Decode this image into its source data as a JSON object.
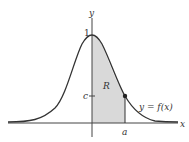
{
  "diagram": {
    "type": "bell-curve-area",
    "labels": {
      "x_axis": "x",
      "y_axis": "y",
      "peak_value": "1",
      "c_label": "c",
      "region": "R",
      "curve": "y = f(x)",
      "a_label": "a"
    },
    "colors": {
      "curve": "#333333",
      "shade": "#d9d9d9",
      "axis": "#444444",
      "background": "#ffffff"
    }
  }
}
